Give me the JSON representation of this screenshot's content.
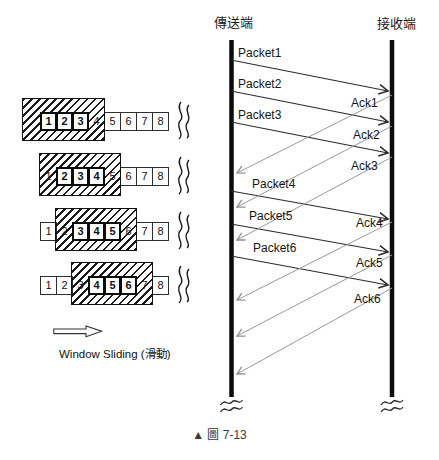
{
  "colors": {
    "ink": "#111111",
    "packet_line": "#2b2b2b",
    "ack_line": "#9a9a9a",
    "background": "#ffffff"
  },
  "sequence": {
    "sender_label": "傳送端",
    "receiver_label": "接收端",
    "packets": [
      "Packet1",
      "Packet2",
      "Packet3",
      "Packet4",
      "Packet5",
      "Packet6"
    ],
    "acks": [
      "Ack1",
      "Ack2",
      "Ack3",
      "Ack4",
      "Ack5",
      "Ack6"
    ]
  },
  "windows": [
    {
      "slots": [
        {
          "n": "1",
          "state": "bold"
        },
        {
          "n": "2",
          "state": "bold"
        },
        {
          "n": "3",
          "state": "bold"
        },
        {
          "n": "4",
          "state": "covered"
        },
        {
          "n": "5",
          "state": "plain"
        },
        {
          "n": "6",
          "state": "plain"
        },
        {
          "n": "7",
          "state": "plain"
        },
        {
          "n": "8",
          "state": "plain"
        }
      ]
    },
    {
      "slots": [
        {
          "n": "1",
          "state": "covered"
        },
        {
          "n": "2",
          "state": "bold"
        },
        {
          "n": "3",
          "state": "bold"
        },
        {
          "n": "4",
          "state": "bold"
        },
        {
          "n": "5",
          "state": "covered"
        },
        {
          "n": "6",
          "state": "plain"
        },
        {
          "n": "7",
          "state": "plain"
        },
        {
          "n": "8",
          "state": "plain"
        }
      ]
    },
    {
      "slots": [
        {
          "n": "1",
          "state": "plain"
        },
        {
          "n": "2",
          "state": "covered"
        },
        {
          "n": "3",
          "state": "bold"
        },
        {
          "n": "4",
          "state": "bold"
        },
        {
          "n": "5",
          "state": "bold"
        },
        {
          "n": "6",
          "state": "covered"
        },
        {
          "n": "7",
          "state": "plain"
        },
        {
          "n": "8",
          "state": "plain"
        }
      ]
    },
    {
      "slots": [
        {
          "n": "1",
          "state": "plain"
        },
        {
          "n": "2",
          "state": "plain"
        },
        {
          "n": "3",
          "state": "covered"
        },
        {
          "n": "4",
          "state": "bold"
        },
        {
          "n": "5",
          "state": "bold"
        },
        {
          "n": "6",
          "state": "bold"
        },
        {
          "n": "7",
          "state": "covered"
        },
        {
          "n": "8",
          "state": "plain"
        }
      ]
    }
  ],
  "legend": {
    "label": "Window Sliding (滑動)"
  },
  "caption": "▲ 圖 7-13",
  "icons": {
    "slide_arrow": "hollow-right-arrow",
    "tape_break": "double-s-squiggle",
    "line_break": "double-wave"
  }
}
